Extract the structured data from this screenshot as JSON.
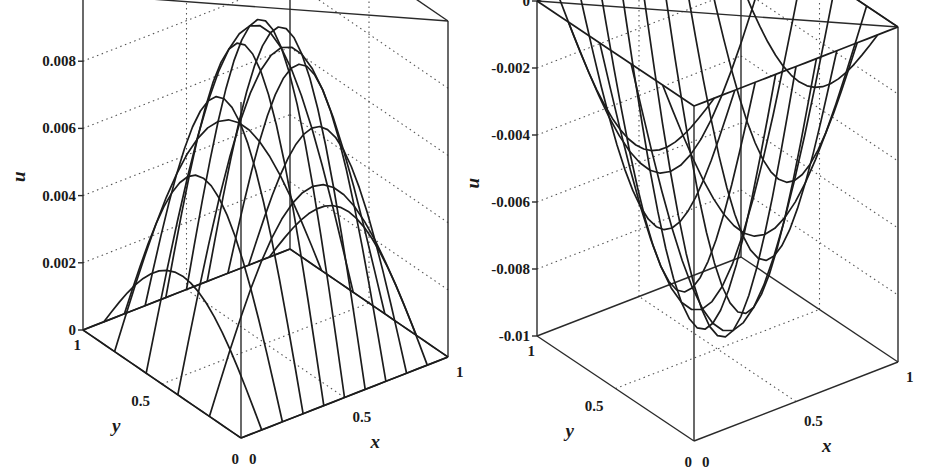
{
  "chart_data": [
    {
      "type": "surface",
      "title": "",
      "xlabel": "x",
      "ylabel": "y",
      "zlabel": "u",
      "xlim": [
        0,
        1
      ],
      "ylim": [
        0,
        1
      ],
      "zlim": [
        0,
        0.01
      ],
      "x_ticks": [
        "0",
        "0.5",
        "1"
      ],
      "y_ticks": [
        "0",
        "0.5",
        "1"
      ],
      "z_ticks": [
        "0",
        "0.002",
        "0.004",
        "0.006",
        "0.008",
        "0.01"
      ],
      "surface": "u(x,y) ≈ 0.0096·sin(πx)·sin(πy)",
      "peak": {
        "x": 0.5,
        "y": 0.5,
        "u": 0.0096
      },
      "grid_mesh": {
        "x_lines": 11,
        "y_lines": 11
      },
      "grid": true
    },
    {
      "type": "surface",
      "title": "",
      "xlabel": "x",
      "ylabel": "y",
      "zlabel": "u",
      "xlim": [
        0,
        1
      ],
      "ylim": [
        0,
        1
      ],
      "zlim": [
        -0.01,
        0
      ],
      "x_ticks": [
        "0",
        "0.5",
        "1"
      ],
      "y_ticks": [
        "0",
        "0.5",
        "1"
      ],
      "z_ticks": [
        "-0.01",
        "-0.008",
        "-0.006",
        "-0.004",
        "-0.002",
        "0"
      ],
      "surface": "u(x,y) ≈ -0.0096·sin(πx)·sin(πy)",
      "trough": {
        "x": 0.5,
        "y": 0.5,
        "u": -0.0096
      },
      "grid_mesh": {
        "x_lines": 11,
        "y_lines": 11
      },
      "grid": true
    }
  ],
  "plots": [
    {
      "id": "left",
      "amplitude": 0.0096,
      "zmin": 0,
      "zmax": 0.01,
      "origin": [
        241,
        438
      ],
      "ex": [
        207,
        -81
      ],
      "ey": [
        -158,
        -108
      ],
      "ez_height": 336,
      "tick_labels_z": [
        "0",
        "0.002",
        "0.004",
        "0.006",
        "0.008",
        "0.01"
      ],
      "tick_labels_x": [
        "0",
        "0.5",
        "1"
      ],
      "tick_labels_y": [
        "0",
        "0.5",
        "1"
      ],
      "labels": {
        "x": "x",
        "y": "y",
        "z": "u"
      }
    },
    {
      "id": "right",
      "amplitude": -0.0096,
      "zmin": -0.01,
      "zmax": 0,
      "origin": [
        694,
        441
      ],
      "ex": [
        204,
        -79
      ],
      "ey": [
        -157,
        -105
      ],
      "ez_height": 335,
      "tick_labels_z": [
        "-0.01",
        "-0.008",
        "-0.006",
        "-0.004",
        "-0.002",
        "0"
      ],
      "tick_labels_x": [
        "0",
        "0.5",
        "1"
      ],
      "tick_labels_y": [
        "0",
        "0.5",
        "1"
      ],
      "labels": {
        "x": "x",
        "y": "y",
        "z": "u"
      }
    }
  ]
}
